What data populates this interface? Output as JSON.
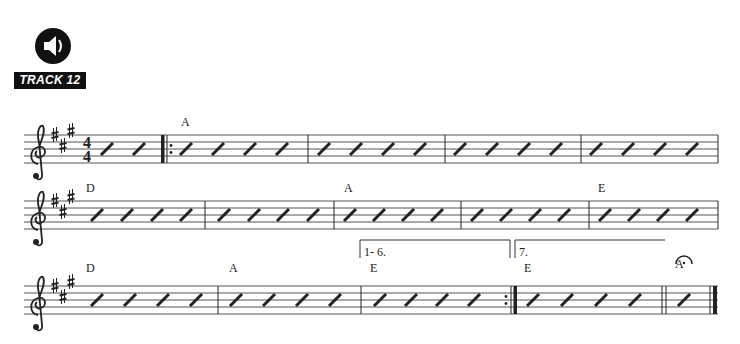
{
  "badge": {
    "icon": "speaker-icon",
    "track_label": "TRACK 12"
  },
  "score": {
    "clef": "treble",
    "key_signature": "A major (3 sharps)",
    "time_signature": {
      "top": "4",
      "bottom": "4"
    },
    "systems": [
      {
        "chords": [
          {
            "label": "A"
          }
        ],
        "measures": [
          {
            "slashes": 2,
            "note": "pickup before repeat"
          },
          {
            "slashes": 4,
            "chord": "A",
            "repeat_start": true
          },
          {
            "slashes": 4
          },
          {
            "slashes": 4
          },
          {
            "slashes": 4
          }
        ]
      },
      {
        "chords": [
          {
            "label": "D"
          },
          {
            "label": "A"
          },
          {
            "label": "E"
          }
        ],
        "measures": [
          {
            "slashes": 4,
            "chord": "D"
          },
          {
            "slashes": 4
          },
          {
            "slashes": 4,
            "chord": "A"
          },
          {
            "slashes": 4
          },
          {
            "slashes": 4,
            "chord": "E"
          }
        ]
      },
      {
        "chords": [
          {
            "label": "D"
          },
          {
            "label": "A"
          },
          {
            "label": "E"
          },
          {
            "label": "E"
          },
          {
            "label": "A"
          }
        ],
        "endings": [
          {
            "label": "1- 6."
          },
          {
            "label": "7."
          }
        ],
        "measures": [
          {
            "slashes": 4,
            "chord": "D"
          },
          {
            "slashes": 4,
            "chord": "A"
          },
          {
            "slashes": 4,
            "chord": "E",
            "ending": "1- 6.",
            "repeat_end": true
          },
          {
            "slashes": 4,
            "chord": "E",
            "ending": "7."
          },
          {
            "slashes": 1,
            "chord": "A",
            "fermata": true,
            "final_barline": true
          }
        ]
      }
    ]
  }
}
